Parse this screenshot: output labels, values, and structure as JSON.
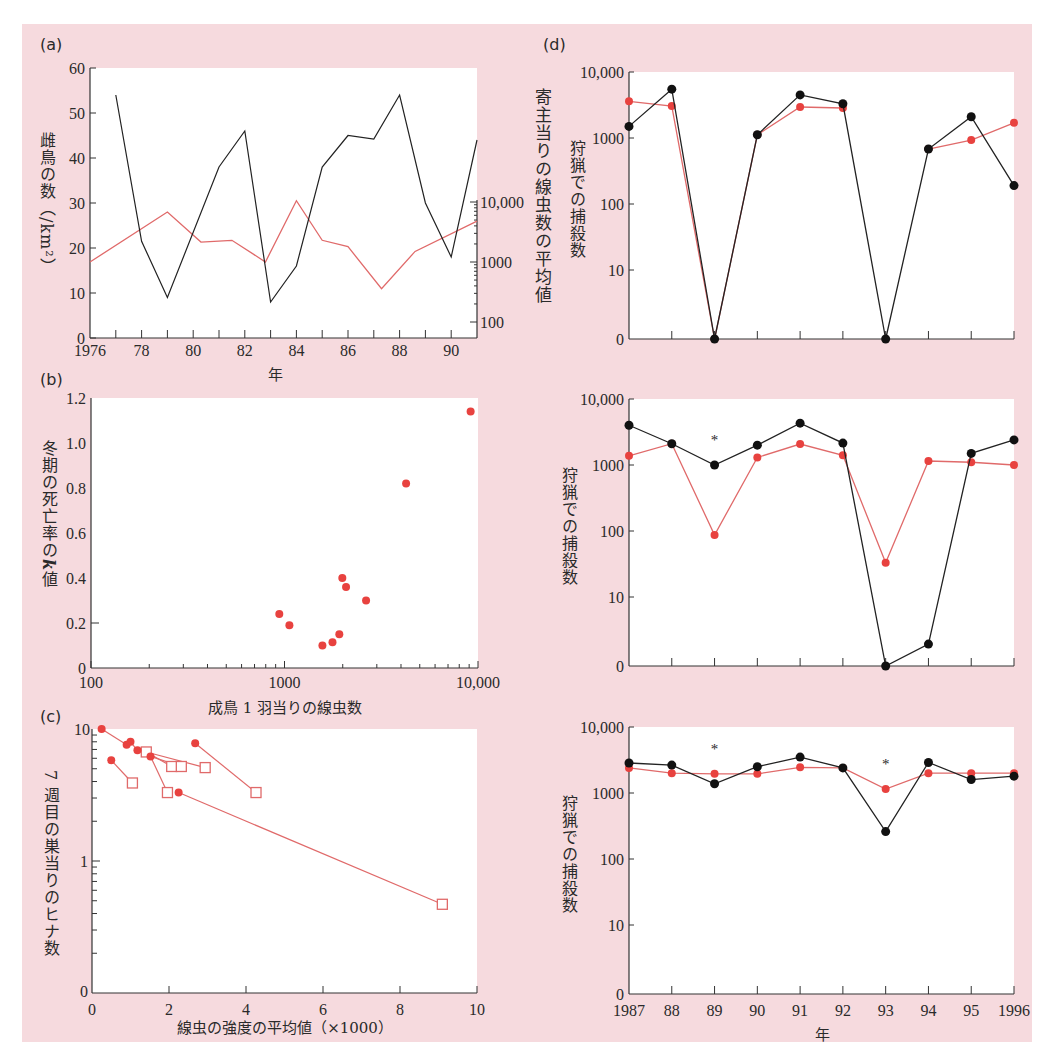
{
  "figure": {
    "background": "#f6dade",
    "plot_background": "#ffffff",
    "black_color": "#111111",
    "red_color": "#e8423f",
    "red_line_color": "#e06a6a"
  },
  "labels": {
    "a": "(a)",
    "b": "(b)",
    "c": "(c)",
    "d": "(d)",
    "a_ylabel": "雌鳥の数（/km²）",
    "a_right_ylabel": "寄主当りの線虫数の平均値",
    "a_xlabel": "年",
    "b_ylabel_text": "冬期の死亡率の",
    "b_ylabel_k": "k",
    "b_ylabel_end": "値",
    "b_xlabel": "成鳥 1 羽当りの線虫数",
    "c_ylabel": "7 週目の巣当りのヒナ数",
    "c_xlabel": "線虫の強度の平均値（×1000）",
    "d_ylabel_top": "狩猟での捕殺数",
    "d_ylabel_mid": "狩猟での捕殺数",
    "d_ylabel_bot": "狩猟での捕殺数",
    "d_xlabel": "年"
  },
  "chart_data": [
    {
      "id": "a",
      "type": "line",
      "title": "(a)",
      "xlabel": "年",
      "ylabel": "雌鳥の数（/km²）",
      "y2label": "寄主当りの線虫数の平均値",
      "xlim": [
        1976,
        1991
      ],
      "ylim": [
        0,
        60
      ],
      "y2_scale": "log",
      "y2lim": [
        60,
        12000
      ],
      "x_tick_labels": [
        "1976",
        "78",
        "80",
        "82",
        "84",
        "86",
        "88",
        "90"
      ],
      "y_ticks": [
        0,
        10,
        20,
        30,
        40,
        50,
        60
      ],
      "y2_tick_labels": [
        "100",
        "1000",
        "10,000"
      ],
      "series": [
        {
          "name": "雌鳥の数 (left axis)",
          "color": "black",
          "x": [
            1977,
            1978,
            1979,
            1981,
            1982,
            1983,
            1984,
            1985,
            1986,
            1987,
            1988,
            1989,
            1990,
            1991
          ],
          "values": [
            54,
            21.5,
            9,
            38,
            46,
            8,
            16,
            38,
            45,
            44.2,
            54,
            30,
            18,
            44
          ]
        },
        {
          "name": "寄主当りの線虫数 (right axis, log)",
          "color": "red",
          "x": [
            1976,
            1979,
            1980.3,
            1981.5,
            1982.8,
            1984,
            1985,
            1986,
            1987.3,
            1988.6,
            1991
          ],
          "values": [
            1000,
            6800,
            2150,
            2300,
            1000,
            10500,
            2300,
            1800,
            360,
            1500,
            4800
          ]
        }
      ]
    },
    {
      "id": "b",
      "type": "scatter",
      "title": "(b)",
      "xlabel": "成鳥 1 羽当りの線虫数",
      "ylabel": "冬期の死亡率の k 値",
      "x_scale": "log",
      "xlim": [
        100,
        10000
      ],
      "ylim": [
        0,
        1.2
      ],
      "x_tick_labels": [
        "100",
        "1000",
        "10,000"
      ],
      "y_tick_labels": [
        "0",
        "0.2",
        "0.4",
        "0.6",
        "0.8",
        "1.0",
        "1.2"
      ],
      "series": [
        {
          "name": "k値",
          "color": "red",
          "x": [
            940,
            1060,
            1570,
            1770,
            1920,
            1990,
            2080,
            2640,
            4250,
            9160
          ],
          "values": [
            0.24,
            0.19,
            0.1,
            0.115,
            0.15,
            0.4,
            0.36,
            0.3,
            0.82,
            1.14
          ]
        }
      ]
    },
    {
      "id": "c",
      "type": "scatter",
      "title": "(c)",
      "xlabel": "線虫の強度の平均値（×1000）",
      "ylabel": "7 週目の巣当りのヒナ数",
      "y_scale": "log",
      "xlim": [
        0,
        10
      ],
      "ylim": [
        0.1,
        10
      ],
      "x_tick_labels": [
        "0",
        "2",
        "4",
        "6",
        "8",
        "10"
      ],
      "y_tick_labels": [
        "0",
        "1",
        "10"
      ],
      "series": [
        {
          "name": "対照 (filled circles)",
          "marker": "circle",
          "color": "red",
          "x": [
            0.25,
            0.9,
            1.0,
            1.18,
            1.52,
            0.5,
            2.68,
            2.25
          ],
          "values": [
            10,
            7.6,
            8.0,
            6.9,
            6.2,
            5.8,
            7.8,
            3.3
          ]
        },
        {
          "name": "処理 (open squares)",
          "marker": "square",
          "color": "red",
          "x": [
            1.41,
            2.07,
            2.32,
            2.94,
            1.05,
            1.96,
            4.26,
            9.1
          ],
          "values": [
            6.7,
            5.2,
            5.2,
            5.1,
            3.9,
            3.3,
            3.3,
            0.47
          ]
        }
      ],
      "segments": [
        [
          [
            0.25,
            10
          ],
          [
            0.9,
            7.6
          ]
        ],
        [
          [
            0.9,
            7.6
          ],
          [
            1.0,
            8.0
          ]
        ],
        [
          [
            1.0,
            8.0
          ],
          [
            1.18,
            6.9
          ]
        ],
        [
          [
            1.18,
            6.9
          ],
          [
            1.41,
            6.7
          ]
        ],
        [
          [
            1.41,
            6.7
          ],
          [
            2.94,
            5.1
          ]
        ],
        [
          [
            1.41,
            6.7
          ],
          [
            2.07,
            5.2
          ]
        ],
        [
          [
            1.52,
            6.2
          ],
          [
            2.32,
            5.2
          ]
        ],
        [
          [
            1.52,
            6.2
          ],
          [
            1.96,
            3.3
          ]
        ],
        [
          [
            0.5,
            5.8
          ],
          [
            1.05,
            3.9
          ]
        ],
        [
          [
            2.68,
            7.8
          ],
          [
            4.26,
            3.3
          ]
        ],
        [
          [
            2.25,
            3.3
          ],
          [
            9.1,
            0.47
          ]
        ]
      ]
    },
    {
      "id": "d-top",
      "type": "line",
      "title": "(d)",
      "ylabel": "狩猟での捕殺数",
      "y_scale": "log",
      "ylim": [
        0,
        10000
      ],
      "y_tick_labels": [
        "0",
        "10",
        "100",
        "1000",
        "10,000"
      ],
      "categories": [
        "1987",
        "88",
        "89",
        "90",
        "91",
        "92",
        "93",
        "94",
        "95",
        "1996"
      ],
      "series": [
        {
          "name": "black",
          "color": "black",
          "values": [
            1500,
            5500,
            0,
            1120,
            4500,
            3300,
            0,
            680,
            2100,
            190
          ]
        },
        {
          "name": "red",
          "color": "red",
          "values": [
            3600,
            3050,
            0,
            1120,
            2950,
            2850,
            null,
            680,
            930,
            1700
          ]
        }
      ]
    },
    {
      "id": "d-mid",
      "type": "line",
      "ylabel": "狩猟での捕殺数",
      "y_scale": "log",
      "ylim": [
        0,
        10000
      ],
      "y_tick_labels": [
        "0",
        "10",
        "100",
        "1000",
        "10,000"
      ],
      "categories": [
        "1987",
        "88",
        "89",
        "90",
        "91",
        "92",
        "93",
        "94",
        "95",
        "1996"
      ],
      "annotations": [
        {
          "text": "*",
          "x": "89"
        }
      ],
      "series": [
        {
          "name": "black",
          "color": "black",
          "values": [
            4000,
            2100,
            1000,
            2000,
            4300,
            2150,
            0,
            2,
            1500,
            2400
          ]
        },
        {
          "name": "red",
          "color": "red",
          "values": [
            1380,
            2100,
            87,
            1300,
            2080,
            1400,
            33,
            1150,
            1100,
            1000
          ]
        }
      ]
    },
    {
      "id": "d-bot",
      "type": "line",
      "xlabel": "年",
      "ylabel": "狩猟での捕殺数",
      "y_scale": "log",
      "ylim": [
        0,
        10000
      ],
      "y_tick_labels": [
        "0",
        "10",
        "100",
        "1000",
        "10,000"
      ],
      "categories": [
        "1987",
        "88",
        "89",
        "90",
        "91",
        "92",
        "93",
        "94",
        "95",
        "1996"
      ],
      "annotations": [
        {
          "text": "*",
          "x": "89"
        },
        {
          "text": "*",
          "x": "93"
        }
      ],
      "series": [
        {
          "name": "black",
          "color": "black",
          "values": [
            2850,
            2650,
            1380,
            2500,
            3500,
            2400,
            260,
            2900,
            1600,
            1800
          ]
        },
        {
          "name": "red",
          "color": "red",
          "values": [
            2400,
            2000,
            1950,
            1950,
            2450,
            2400,
            1150,
            2000,
            2000,
            2000
          ]
        }
      ]
    }
  ]
}
